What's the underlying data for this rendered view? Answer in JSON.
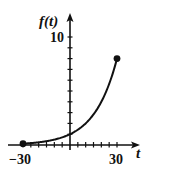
{
  "chart_data": {
    "type": "line",
    "title": "",
    "xlabel": "t",
    "ylabel": "f(t)",
    "x_ticks_labeled": [
      "-30",
      "30"
    ],
    "y_ticks_labeled": [
      "10"
    ],
    "x_tick_step": 5,
    "y_tick_step": 1,
    "xlim": [
      -30,
      30
    ],
    "ylim": [
      0,
      10
    ],
    "grid": false,
    "legend": null,
    "series": [
      {
        "name": "f(t)",
        "function": "2^(t/10)",
        "x": [
          -30,
          -25,
          -20,
          -15,
          -10,
          -5,
          0,
          5,
          10,
          15,
          20,
          25,
          30
        ],
        "values": [
          0.125,
          0.177,
          0.25,
          0.354,
          0.5,
          0.707,
          1,
          1.414,
          2,
          2.828,
          4,
          5.657,
          8
        ]
      }
    ],
    "endpoints": [
      {
        "x": -30,
        "y": 0.125,
        "style": "closed-dot"
      },
      {
        "x": 30,
        "y": 8,
        "style": "closed-dot"
      }
    ],
    "color": "#111111"
  },
  "labels": {
    "y_axis": "f(t)",
    "x_axis": "t",
    "y_top": "10",
    "x_left": "−30",
    "x_right": "30"
  }
}
